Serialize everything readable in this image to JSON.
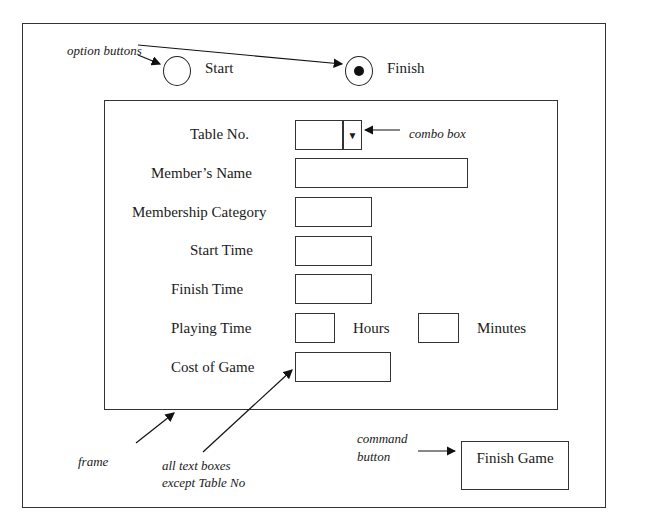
{
  "annotations": {
    "option_buttons": "option buttons",
    "combo_box": "combo box",
    "frame": "frame",
    "text_boxes_line1": "all text boxes",
    "text_boxes_line2": "except Table No",
    "command_button_line1": "command",
    "command_button_line2": "button"
  },
  "options": [
    {
      "label": "Start",
      "selected": false
    },
    {
      "label": "Finish",
      "selected": true
    }
  ],
  "form": {
    "table_no": {
      "label": "Table No.",
      "value": ""
    },
    "members_name": {
      "label": "Member’s Name",
      "value": ""
    },
    "membership_category": {
      "label": "Membership Category",
      "value": ""
    },
    "start_time": {
      "label": "Start Time",
      "value": ""
    },
    "finish_time": {
      "label": "Finish Time",
      "value": ""
    },
    "playing_time": {
      "label": "Playing Time",
      "hours_label": "Hours",
      "minutes_label": "Minutes",
      "hours_value": "",
      "minutes_value": ""
    },
    "cost_of_game": {
      "label": "Cost of Game",
      "value": ""
    }
  },
  "buttons": {
    "finish_game": "Finish Game"
  }
}
